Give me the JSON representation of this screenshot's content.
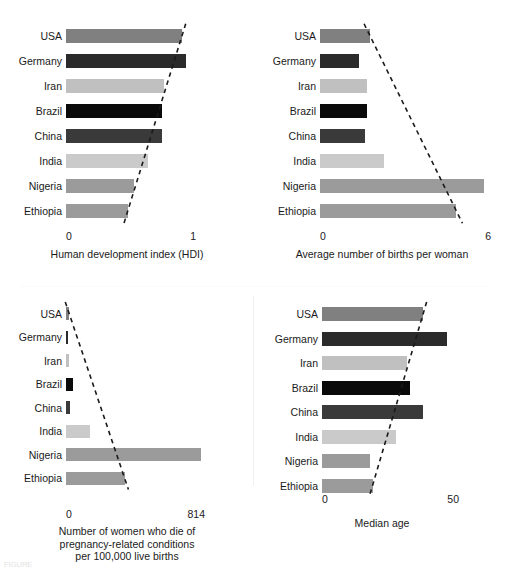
{
  "figure": {
    "countries": [
      "USA",
      "Germany",
      "Iran",
      "Brazil",
      "China",
      "India",
      "Nigeria",
      "Ethiopia"
    ],
    "bar_colors": {
      "USA": "#808080",
      "Germany": "#2b2b2b",
      "Iran": "#c0c0c0",
      "Brazil": "#0a0a0a",
      "China": "#3a3a3a",
      "India": "#cacaca",
      "Nigeria": "#9b9b9b",
      "Ethiopia": "#9b9b9b"
    },
    "trendline_color": "#1a1a1a",
    "page_artifacts": {
      "top_cropped_text": "",
      "bottom_cropped_text": "FIGURE"
    }
  },
  "chart_data": [
    {
      "type": "bar",
      "panel": "top-left",
      "title": "",
      "xlabel": "Human development index (HDI)",
      "ylabel": "",
      "orientation": "horizontal",
      "categories": [
        "USA",
        "Germany",
        "Iran",
        "Brazil",
        "China",
        "India",
        "Nigeria",
        "Ethiopia"
      ],
      "values": [
        0.92,
        0.95,
        0.78,
        0.76,
        0.76,
        0.65,
        0.54,
        0.49
      ],
      "xlim": [
        0,
        1
      ],
      "xticks": [
        0,
        1
      ],
      "xticklabels": [
        "0",
        "1"
      ],
      "grid": false,
      "legend": "none",
      "annotations": [
        "dashed trend line descending left-to-right across bar ends"
      ]
    },
    {
      "type": "bar",
      "panel": "top-right",
      "title": "",
      "xlabel": "Average number of births per woman",
      "ylabel": "",
      "orientation": "horizontal",
      "categories": [
        "USA",
        "Germany",
        "Iran",
        "Brazil",
        "China",
        "India",
        "Nigeria",
        "Ethiopia"
      ],
      "values": [
        1.8,
        1.4,
        1.7,
        1.7,
        1.6,
        2.3,
        5.9,
        4.9
      ],
      "xlim": [
        0,
        6
      ],
      "xticks": [
        0,
        6
      ],
      "xticklabels": [
        "0",
        "6"
      ],
      "grid": false,
      "legend": "none",
      "annotations": [
        "dashed trend line descending left-to-right across bar ends"
      ]
    },
    {
      "type": "bar",
      "panel": "bottom-left",
      "title": "",
      "xlabel": "Number of women who die of pregnancy-related conditions per 100,000 live births",
      "xlabel_lines": [
        "Number of women who die of",
        "pregnancy-related conditions",
        "per 100,000 live births"
      ],
      "ylabel": "",
      "orientation": "horizontal",
      "categories": [
        "USA",
        "Germany",
        "Iran",
        "Brazil",
        "China",
        "India",
        "Nigeria",
        "Ethiopia"
      ],
      "values": [
        19,
        7,
        21,
        44,
        27,
        145,
        814,
        353
      ],
      "xlim": [
        0,
        814
      ],
      "xticks": [
        0,
        814
      ],
      "xticklabels": [
        "0",
        "814"
      ],
      "grid": false,
      "legend": "none",
      "annotations": [
        "dashed trend line descending left-to-right across bar ends"
      ]
    },
    {
      "type": "bar",
      "panel": "bottom-right",
      "title": "",
      "xlabel": "Median age",
      "ylabel": "",
      "orientation": "horizontal",
      "categories": [
        "USA",
        "Germany",
        "Iran",
        "Brazil",
        "China",
        "India",
        "Nigeria",
        "Ethiopia"
      ],
      "values": [
        38,
        47,
        32,
        33,
        38,
        28,
        18,
        19
      ],
      "xlim": [
        0,
        50
      ],
      "xticks": [
        0,
        50
      ],
      "xticklabels": [
        "0",
        "50"
      ],
      "grid": false,
      "legend": "none",
      "annotations": [
        "dashed trend line descending left-to-right across bar ends"
      ]
    }
  ]
}
